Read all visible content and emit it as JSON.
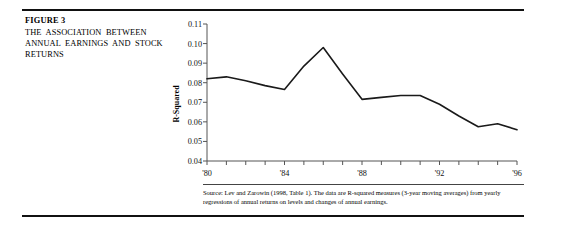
{
  "figure": {
    "number": "FIGURE 3",
    "title": "THE ASSOCIATION BETWEEN ANNUAL EARNINGS AND STOCK RETURNS"
  },
  "source_note": "Source: Lev and Zarowin (1998, Table 1). The data are R-squared measures (3-year moving averages) from yearly regressions of annual returns on levels and changes of annual earnings.",
  "chart_data": {
    "type": "line",
    "title": "",
    "subtitle": "",
    "xlabel": "",
    "ylabel": "R-Squared",
    "x": [
      1980,
      1981,
      1982,
      1983,
      1984,
      1985,
      1986,
      1987,
      1988,
      1989,
      1990,
      1991,
      1992,
      1993,
      1994,
      1995,
      1996
    ],
    "values": [
      0.082,
      0.083,
      0.081,
      0.0785,
      0.0765,
      0.0885,
      0.098,
      0.0845,
      0.0715,
      0.0725,
      0.0735,
      0.0735,
      0.069,
      0.063,
      0.0575,
      0.059,
      0.056
    ],
    "xlim": [
      1980,
      1996
    ],
    "ylim": [
      0.04,
      0.11
    ],
    "yticks": [
      0.04,
      0.05,
      0.06,
      0.07,
      0.08,
      0.09,
      0.1,
      0.11
    ],
    "ytick_labels": [
      "0.04",
      "0.05",
      "0.06",
      "0.07",
      "0.08",
      "0.09",
      "0.10",
      "0.11"
    ],
    "xticks": [
      1980,
      1981,
      1982,
      1983,
      1984,
      1985,
      1986,
      1987,
      1988,
      1989,
      1990,
      1991,
      1992,
      1993,
      1994,
      1995,
      1996
    ],
    "xtick_labels": [
      "'80",
      "",
      "",
      "",
      "'84",
      "",
      "",
      "",
      "'88",
      "",
      "",
      "",
      "'92",
      "",
      "",
      "",
      "'96"
    ],
    "labeled_xticks": [
      "'80",
      "'84",
      "'88",
      "'92",
      "'96"
    ],
    "grid": false,
    "legend": false,
    "line_color": "#1a1a1a",
    "axis_color": "#555555"
  }
}
